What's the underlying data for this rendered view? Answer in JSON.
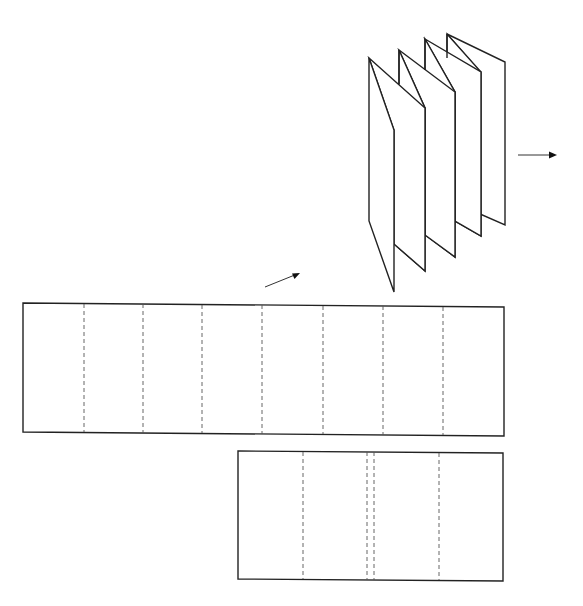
{
  "diagram": {
    "title": "",
    "description_visible_text": "",
    "colors": {
      "stroke": "#222222",
      "fold_line": "#555555",
      "background": "#ffffff"
    },
    "nodes": [
      {
        "id": "folded-sheet",
        "type": "accordion-fold-3d",
        "panels": 8,
        "apexes": [
          [
            369,
            58
          ],
          [
            399,
            50
          ],
          [
            425,
            39
          ],
          [
            447,
            34
          ]
        ],
        "right_edge_x": 505
      },
      {
        "id": "flat-sheet-long",
        "type": "rectangle-with-fold-lines",
        "corners": [
          [
            23,
            303
          ],
          [
            504,
            307
          ],
          [
            504,
            436
          ],
          [
            23,
            432
          ]
        ],
        "fold_lines_x": [
          84,
          143,
          202,
          262,
          323,
          383,
          443
        ],
        "fold_style": "dashed"
      },
      {
        "id": "flat-sheet-short",
        "type": "rectangle-with-fold-lines",
        "corners": [
          [
            238,
            451
          ],
          [
            503,
            453
          ],
          [
            503,
            581
          ],
          [
            238,
            579
          ]
        ],
        "fold_lines_x": [
          303,
          367,
          374,
          439
        ],
        "fold_style": "dashed"
      }
    ],
    "arrows": [
      {
        "id": "arrow-to-folded",
        "from": [
          265,
          287
        ],
        "to": [
          300,
          273
        ]
      },
      {
        "id": "arrow-right",
        "from": [
          518,
          155
        ],
        "to": [
          556,
          155
        ]
      }
    ]
  }
}
